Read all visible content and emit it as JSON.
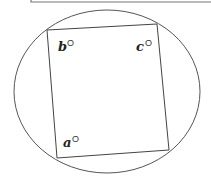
{
  "diagram": {
    "type": "quadrilateral-inscribed-in-ellipse",
    "colors": {
      "stroke": "#555555",
      "text": "#222222",
      "frame": "#777777"
    },
    "frame": {
      "left": 31,
      "bottom": 2
    },
    "ellipse": {
      "cx": 107,
      "cy": 91.5,
      "rx": 93,
      "ry": 81.5
    },
    "quad": {
      "top_left": [
        47,
        30
      ],
      "top_right": [
        157,
        24
      ],
      "bottom_right": [
        169,
        150
      ],
      "bottom_left": [
        57,
        158
      ]
    },
    "labels": [
      {
        "id": "b",
        "text": "b",
        "sup": "O",
        "x": 58,
        "y": 51
      },
      {
        "id": "c",
        "text": "c",
        "sup": "O",
        "x": 136,
        "y": 51
      },
      {
        "id": "a",
        "text": "a",
        "sup": "O",
        "x": 63,
        "y": 147
      }
    ]
  }
}
